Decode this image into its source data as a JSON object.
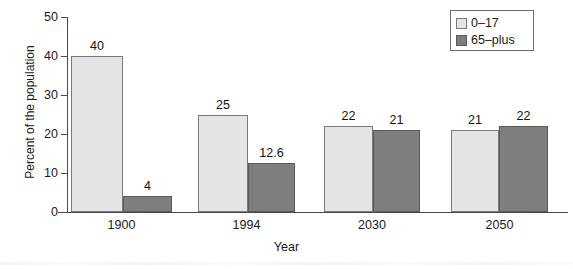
{
  "chart_data": {
    "type": "bar",
    "title": "",
    "xlabel": "Year",
    "ylabel": "Percent of the population",
    "categories": [
      "1900",
      "1994",
      "2030",
      "2050"
    ],
    "series": [
      {
        "name": "0–17",
        "values": [
          40,
          25,
          22,
          21
        ],
        "labels": [
          "40",
          "25",
          "22",
          "21"
        ],
        "color": "#e4e4e4"
      },
      {
        "name": "65–plus",
        "values": [
          4,
          12.6,
          21,
          22
        ],
        "labels": [
          "4",
          "12.6",
          "21",
          "22"
        ],
        "color": "#7e7e7e"
      }
    ],
    "ylim": [
      0,
      50
    ],
    "yticks": [
      0,
      10,
      20,
      30,
      40,
      50
    ],
    "ytick_labels": [
      "0",
      "10",
      "20",
      "30",
      "40",
      "50"
    ],
    "grid": false,
    "legend_position": "top-right"
  },
  "legend": {
    "entries": [
      {
        "label": "0–17",
        "swatch": "light-gray-swatch"
      },
      {
        "label": "65–plus",
        "swatch": "dark-gray-swatch"
      }
    ]
  }
}
